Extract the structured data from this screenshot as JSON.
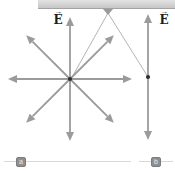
{
  "figure": {
    "background": "#ffffff",
    "colors": {
      "arrow": "#9b9b9b",
      "dot": "#2f2f2f",
      "string": "#b5b5b5",
      "hook": "#9b9b9b",
      "baseline": "#d9d9d9",
      "bar_fill_top": "#e3e3e3",
      "bar_fill_bottom": "#c6c6c6",
      "label_text": "#1c1c1c",
      "badge_fill": "#8f8f8f",
      "badge_text": "#ececec"
    },
    "ceiling_bar": {
      "x": 38,
      "y": 0,
      "width": 137,
      "height": 9
    },
    "hook": {
      "points": [
        [
          103,
          9
        ],
        [
          113,
          9
        ],
        [
          108,
          15
        ]
      ]
    },
    "strings": [
      {
        "x1": 108,
        "y1": 13,
        "x2": 71,
        "y2": 79
      },
      {
        "x1": 108,
        "y1": 13,
        "x2": 148,
        "y2": 77
      }
    ],
    "left_charge": {
      "cx": 70,
      "cy": 79,
      "dot_r": 2.1,
      "arrow_radius": 62,
      "arrow_angles_deg": [
        0,
        45,
        90,
        135,
        180,
        225,
        270,
        315
      ]
    },
    "right_charge": {
      "cx": 148,
      "cy": 77,
      "dot_r": 2.1,
      "arrows": [
        {
          "x2": 148,
          "y2": 14
        },
        {
          "x2": 148,
          "y2": 140
        }
      ]
    },
    "arrow_style": {
      "shaft_width": 1.8,
      "head_length": 9,
      "head_half_width": 4
    },
    "field_labels": [
      {
        "text": "E",
        "arrow": "→",
        "left": 50,
        "top": 9
      },
      {
        "text": "E",
        "arrow": "→",
        "left": 156,
        "top": 9
      }
    ],
    "baselines": [
      {
        "x1": 4,
        "y1": 161.5,
        "x2": 131,
        "y2": 161.5
      },
      {
        "x1": 139,
        "y1": 161.5,
        "x2": 173,
        "y2": 161.5
      }
    ],
    "panel_labels": [
      {
        "text": "a",
        "left": 16,
        "top": 156.5
      },
      {
        "text": "b",
        "left": 151,
        "top": 156.5
      }
    ]
  }
}
